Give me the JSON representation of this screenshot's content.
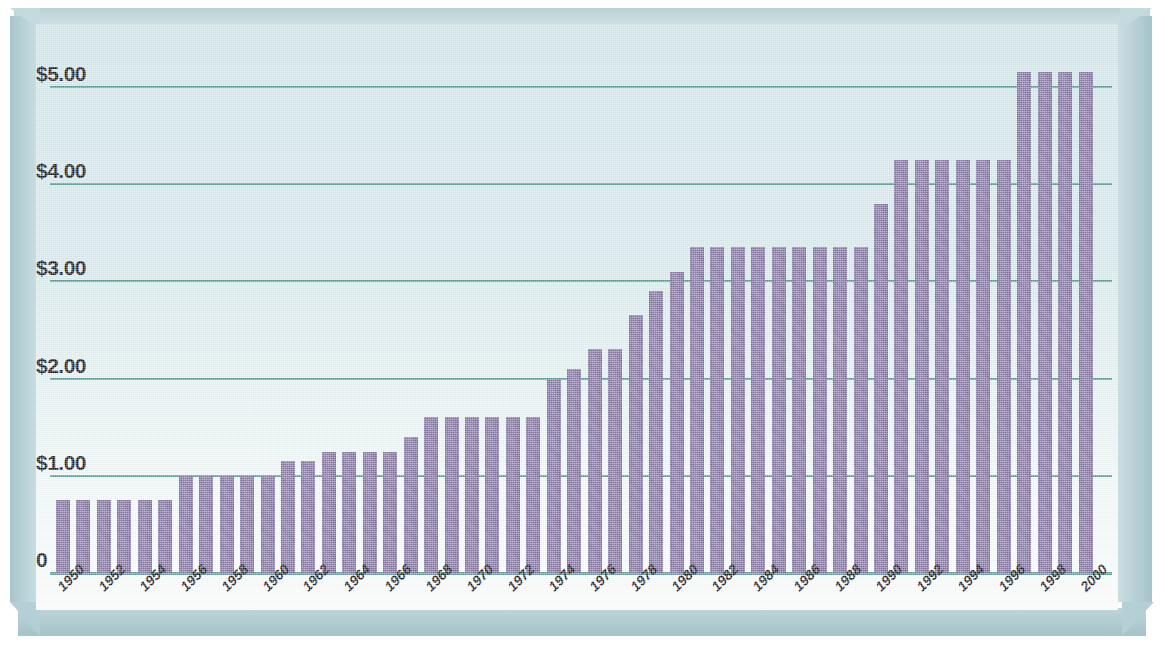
{
  "chart_data": {
    "type": "bar",
    "title": "",
    "xlabel": "",
    "ylabel": "",
    "ylim": [
      0,
      5.6
    ],
    "grid": true,
    "legend": "none",
    "y_ticks": [
      {
        "label": "$5.00",
        "value": 5.0
      },
      {
        "label": "$4.00",
        "value": 4.0
      },
      {
        "label": "$3.00",
        "value": 3.0
      },
      {
        "label": "$2.00",
        "value": 2.0
      },
      {
        "label": "$1.00",
        "value": 1.0
      },
      {
        "label": "0",
        "value": 0
      }
    ],
    "x_tick_labels": [
      "1950",
      "1952",
      "1954",
      "1956",
      "1958",
      "1960",
      "1962",
      "1964",
      "1966",
      "1968",
      "1970",
      "1972",
      "1974",
      "1976",
      "1978",
      "1980",
      "1982",
      "1984",
      "1986",
      "1988",
      "1990",
      "1992",
      "1994",
      "1996",
      "1998",
      "2000"
    ],
    "categories": [
      "1950",
      "1951",
      "1952",
      "1953",
      "1954",
      "1955",
      "1956",
      "1957",
      "1958",
      "1959",
      "1960",
      "1961",
      "1962",
      "1963",
      "1964",
      "1965",
      "1966",
      "1967",
      "1968",
      "1969",
      "1970",
      "1971",
      "1972",
      "1973",
      "1974",
      "1975",
      "1976",
      "1977",
      "1978",
      "1979",
      "1980",
      "1981",
      "1982",
      "1983",
      "1984",
      "1985",
      "1986",
      "1987",
      "1988",
      "1989",
      "1990",
      "1991",
      "1992",
      "1993",
      "1994",
      "1995",
      "1996",
      "1997",
      "1998",
      "1999",
      "2000"
    ],
    "values": [
      0.75,
      0.75,
      0.75,
      0.75,
      0.75,
      0.75,
      1.0,
      1.0,
      1.0,
      1.0,
      1.0,
      1.15,
      1.15,
      1.25,
      1.25,
      1.25,
      1.25,
      1.4,
      1.6,
      1.6,
      1.6,
      1.6,
      1.6,
      1.6,
      2.0,
      2.1,
      2.3,
      2.3,
      2.65,
      2.9,
      3.1,
      3.35,
      3.35,
      3.35,
      3.35,
      3.35,
      3.35,
      3.35,
      3.35,
      3.35,
      3.8,
      4.25,
      4.25,
      4.25,
      4.25,
      4.25,
      4.25,
      5.15,
      5.15,
      5.15,
      5.15
    ],
    "colors": {
      "bar": "#82719f",
      "gridline": "#3e8f86",
      "background_top": "#d2e5e9",
      "background_bottom": "#fbfdfd",
      "frame": "#b4cfd5",
      "label_text": "#1a1a1a"
    }
  }
}
